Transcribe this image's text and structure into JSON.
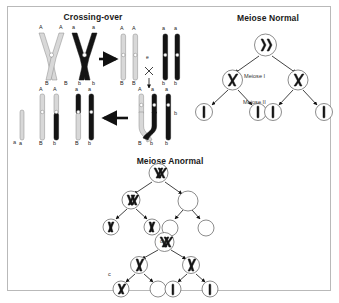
{
  "figure": {
    "width": 339,
    "height": 303,
    "background": "#ffffff",
    "border_color": "#b9b9b9"
  },
  "panels": {
    "crossing_over": {
      "title": "Crossing-over",
      "panel_letter": "a",
      "stage_letter": "e",
      "allele_labels_top_left": [
        "A",
        "A"
      ],
      "allele_labels_top_right": [
        "a",
        "a"
      ],
      "allele_labels_bottom_left": [
        "B",
        "B"
      ],
      "allele_labels_bottom_right": [
        "b",
        "b"
      ],
      "row1_products": [
        {
          "top": "A",
          "bottom": "B"
        },
        {
          "top": "A",
          "bottom": "B"
        },
        {
          "top": "a",
          "bottom": "b"
        },
        {
          "top": "a",
          "bottom": "b"
        }
      ],
      "row2_products": [
        {
          "top": "A",
          "bottom": "B"
        },
        {
          "top": "A",
          "bottom": "b"
        },
        {
          "top": "a",
          "bottom": "B"
        },
        {
          "top": "a",
          "bottom": "b"
        }
      ],
      "recomb_labels": [
        {
          "top": "A",
          "bottom": "B"
        },
        {
          "top": "a",
          "bottom": "b"
        },
        {
          "top": "a",
          "bottom": "b"
        },
        {
          "top": "A",
          "bottom": "B"
        }
      ]
    },
    "meiose_normal": {
      "title": "Meiose Normal",
      "panel_letter": "b",
      "stages": [
        "Meiose I",
        "Meiose II"
      ],
      "tree": {
        "root": {
          "glyph": "bivalent"
        },
        "level1": [
          {
            "glyph": "dyad"
          },
          {
            "glyph": "dyad"
          }
        ],
        "level2": [
          {
            "glyph": "monad"
          },
          {
            "glyph": "monad"
          },
          {
            "glyph": "monad"
          },
          {
            "glyph": "monad"
          }
        ]
      }
    },
    "meiose_anormal": {
      "title": "Meiose Anormal",
      "panel_letter": "c",
      "connector": "ou",
      "tree_top": {
        "root": {
          "glyph": "bivalent"
        },
        "level1": [
          {
            "glyph": "bivalent"
          },
          {
            "glyph": "empty"
          }
        ],
        "level2": [
          {
            "glyph": "dyad"
          },
          {
            "glyph": "dyad"
          },
          {
            "glyph": "empty"
          },
          {
            "glyph": "empty"
          }
        ]
      },
      "tree_bottom": {
        "root": {
          "glyph": "bivalent"
        },
        "level1": [
          {
            "glyph": "dyad"
          },
          {
            "glyph": "dyad"
          }
        ],
        "level2": [
          {
            "glyph": "dyad"
          },
          {
            "glyph": "empty"
          },
          {
            "glyph": "monad"
          },
          {
            "glyph": "monad"
          }
        ]
      }
    }
  },
  "colors": {
    "chromosome_light": "#d8d8d8",
    "chromosome_dark": "#141414",
    "outline": "#5a5a5a",
    "text": "#1a1a1a"
  }
}
